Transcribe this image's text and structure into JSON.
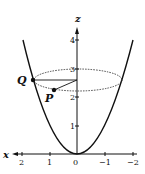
{
  "figure": {
    "axes": {
      "z_label": "z",
      "x_label": "x",
      "z_ticks": [
        "1",
        "2",
        "3",
        "4"
      ],
      "x_ticks": [
        "2",
        "1",
        "0",
        "−1",
        "−2"
      ]
    },
    "points": {
      "Q": "Q",
      "P": "P"
    },
    "colors": {
      "ink": "#111111",
      "background": "#ffffff"
    }
  }
}
